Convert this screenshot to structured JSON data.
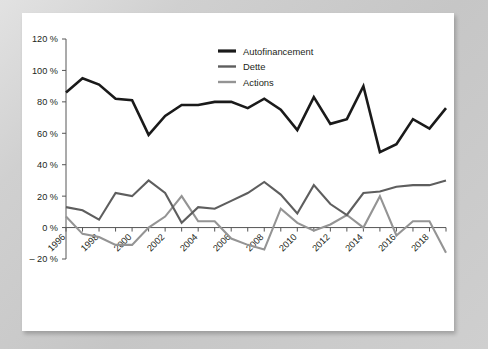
{
  "figure": {
    "background_color": "#c9c9c9",
    "card_color": "#ffffff"
  },
  "chart_data": {
    "type": "line",
    "title": "",
    "subtitle": "",
    "xlabel": "",
    "ylabel": "",
    "ylim": [
      -20,
      120
    ],
    "ytick_values": [
      -20,
      0,
      20,
      40,
      60,
      80,
      100,
      120
    ],
    "ytick_labels": [
      "– 20 %",
      "0 %",
      "20 %",
      "40 %",
      "60 %",
      "80 %",
      "100 %",
      "120 %"
    ],
    "grid": false,
    "legend_position": "top-center",
    "x": [
      1996,
      1997,
      1998,
      1999,
      2000,
      2001,
      2002,
      2003,
      2004,
      2005,
      2006,
      2007,
      2008,
      2009,
      2010,
      2011,
      2012,
      2013,
      2014,
      2015,
      2016,
      2017,
      2018,
      2019
    ],
    "xtick_labeled": [
      1996,
      1998,
      2000,
      2002,
      2004,
      2006,
      2008,
      2010,
      2012,
      2014,
      2016,
      2018
    ],
    "xtick_labels": [
      "1996",
      "1998",
      "2000",
      "2002",
      "2004",
      "2006",
      "2008",
      "2010",
      "2012",
      "2014",
      "2016",
      "2018"
    ],
    "series": [
      {
        "name": "Autofinancement",
        "color": "#1a1a1a",
        "width": 2.6,
        "values": [
          86,
          95,
          91,
          82,
          81,
          59,
          71,
          78,
          78,
          80,
          80,
          76,
          82,
          75,
          62,
          83,
          66,
          69,
          90,
          48,
          53,
          69,
          63,
          76
        ]
      },
      {
        "name": "Dette",
        "color": "#5e5e5e",
        "width": 2.1,
        "values": [
          13,
          11,
          5,
          22,
          20,
          30,
          22,
          3,
          13,
          12,
          17,
          22,
          29,
          21,
          9,
          27,
          15,
          8,
          22,
          23,
          26,
          27,
          27,
          30
        ]
      },
      {
        "name": "Actions",
        "color": "#949494",
        "width": 2.1,
        "values": [
          7,
          -4,
          -6,
          -11,
          -11,
          0,
          7,
          20,
          4,
          4,
          -7,
          -11,
          -14,
          12,
          3,
          -2,
          2,
          8,
          0,
          20,
          -5,
          4,
          4,
          -16
        ]
      }
    ]
  },
  "legend": {
    "items": [
      {
        "label": "Autofinancement",
        "color": "#1a1a1a"
      },
      {
        "label": "Dette",
        "color": "#5e5e5e"
      },
      {
        "label": "Actions",
        "color": "#949494"
      }
    ]
  }
}
